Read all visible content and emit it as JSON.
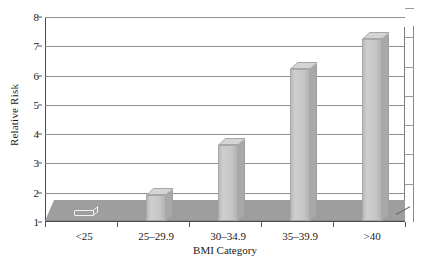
{
  "chart_data": {
    "type": "bar",
    "title": "",
    "subtitle": "",
    "xlabel": "BMI Category",
    "ylabel": "Relative Risk",
    "categories": [
      "<25",
      "25–29.9",
      "30–34.9",
      "35–39.9",
      ">40"
    ],
    "values": [
      1.0,
      1.9,
      3.6,
      6.2,
      7.2
    ],
    "series": [
      {
        "name": "Relative Risk",
        "values": [
          1.0,
          1.9,
          3.6,
          6.2,
          7.2
        ]
      }
    ],
    "ylim": [
      1,
      8
    ],
    "yticks": [
      1,
      2,
      3,
      4,
      5,
      6,
      7,
      8
    ],
    "ytick_labels": [
      "1",
      "2",
      "3",
      "4",
      "5",
      "6",
      "7",
      "8"
    ],
    "xlim_categories": 5,
    "grid": true,
    "grid_axis": "y",
    "legend": false,
    "legend_position": "none",
    "style": "3d-column",
    "annotations": []
  },
  "colors": {
    "bar_face": "#c6c6c6",
    "bar_side": "#a9a9a9",
    "bar_top": "#d4d4d4",
    "bar_outline": "#a8a8a8",
    "floor": "#9e9e9e",
    "gridline": "#8f8f8f",
    "axis": "#4a4a4a",
    "background": "#ffffff",
    "text": "#1a1a1a"
  },
  "axes": {
    "y": {
      "title": "Relative Risk",
      "ticks": [
        "8",
        "7",
        "6",
        "5",
        "4",
        "3",
        "2",
        "1"
      ]
    },
    "x": {
      "title": "BMI Category",
      "ticks": [
        "<25",
        "25–29.9",
        "30–34.9",
        "35–39.9",
        ">40"
      ]
    }
  }
}
